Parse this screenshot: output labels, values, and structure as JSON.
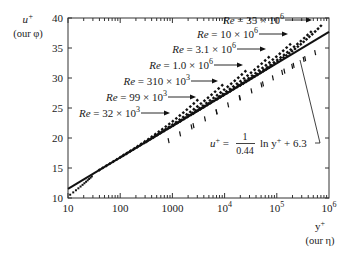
{
  "chart_data": {
    "type": "line",
    "title": "",
    "xlabel": "y+",
    "xlabel_note": "(our η)",
    "ylabel": "u+",
    "ylabel_note": "(our φ)",
    "xscale": "log",
    "xlim": [
      10,
      1000000
    ],
    "ylim": [
      10,
      40
    ],
    "x_ticks": [
      {
        "value": 10,
        "label": "10"
      },
      {
        "value": 100,
        "label": "100"
      },
      {
        "value": 1000,
        "label": "1000"
      },
      {
        "value": 10000,
        "label": "10",
        "sup": "4"
      },
      {
        "value": 100000,
        "label": "10",
        "sup": "5"
      },
      {
        "value": 1000000,
        "label": "10",
        "sup": "6"
      }
    ],
    "y_ticks": [
      10,
      15,
      20,
      25,
      30,
      35,
      40
    ],
    "grid": false,
    "series": [
      {
        "name": "Log law fit",
        "formula_lhs": "u+ =",
        "formula_num": "1",
        "formula_den": "0.44",
        "formula_rhs": "ln y+ + 6.3",
        "kappa": 0.44,
        "B": 6.3,
        "x": [
          10,
          100,
          1000,
          10000,
          100000,
          1000000
        ],
        "y": [
          11.5,
          16.8,
          22.0,
          27.2,
          32.5,
          37.7
        ]
      },
      {
        "name": "Re = 32 × 10^3",
        "re_label": "Re = 32 × 10",
        "re_exp": "3",
        "x_end": 3000,
        "y_end": 24.5
      },
      {
        "name": "Re = 99 × 10^3",
        "re_label": "Re = 99 × 10",
        "re_exp": "3",
        "x_end": 9000,
        "y_end": 26.5
      },
      {
        "name": "Re = 310 × 10^3",
        "re_label": "Re = 310 × 10",
        "re_exp": "3",
        "x_end": 25000,
        "y_end": 29.0
      },
      {
        "name": "Re = 1.0 × 10^6",
        "re_label": "Re = 1.0 × 10",
        "re_exp": "6",
        "x_end": 70000,
        "y_end": 31.0
      },
      {
        "name": "Re = 3.1 × 10^6",
        "re_label": "Re = 3.1 × 10",
        "re_exp": "6",
        "x_end": 180000,
        "y_end": 33.5
      },
      {
        "name": "Re = 10 × 10^6",
        "re_label": "Re = 10 × 10",
        "re_exp": "6",
        "x_end": 450000,
        "y_end": 35.5
      },
      {
        "name": "Re = 35 × 10^6",
        "re_label": "Re = 35 × 10",
        "re_exp": "6",
        "x_end": 700000,
        "y_end": 37.5
      }
    ],
    "legend_position": "inline annotations with arrows"
  }
}
